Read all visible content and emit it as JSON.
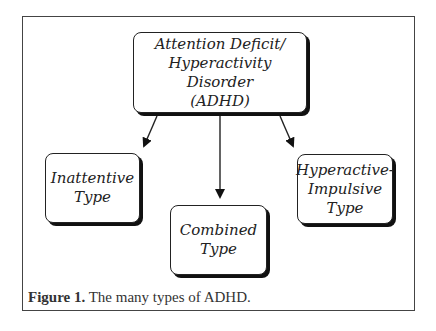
{
  "diagram": {
    "root": {
      "lines": [
        "Attention Deficit/",
        "Hyperactivity Disorder",
        "(ADHD)"
      ]
    },
    "children": [
      {
        "id": "inattentive",
        "lines": [
          "Inattentive",
          "Type"
        ]
      },
      {
        "id": "combined",
        "lines": [
          "Combined",
          "Type"
        ]
      },
      {
        "id": "hyperactive",
        "lines": [
          "Hyperactive-",
          "Impulsive",
          "Type"
        ]
      }
    ],
    "edges": [
      {
        "from": "root",
        "to": "inattentive"
      },
      {
        "from": "root",
        "to": "combined"
      },
      {
        "from": "root",
        "to": "hyperactive"
      }
    ]
  },
  "caption": {
    "label": "Figure 1.",
    "text": " The many types of ADHD."
  },
  "colors": {
    "line": "#222222",
    "shadow": "#111111",
    "background": "#ffffff"
  }
}
